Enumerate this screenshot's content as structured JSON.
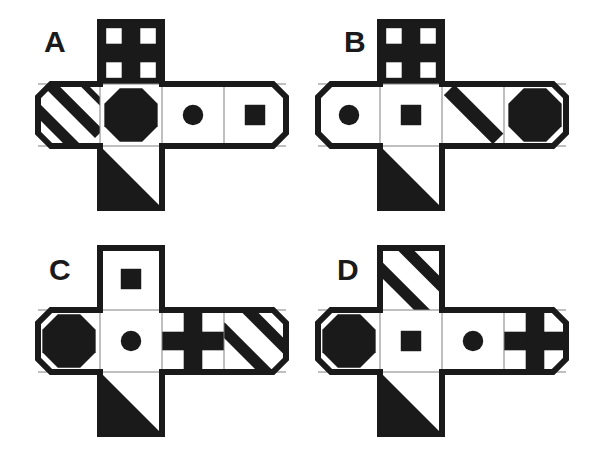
{
  "page": {
    "background_color": "#ffffff",
    "ink_color": "#1a1a1a",
    "width": 599,
    "height": 451
  },
  "geometry": {
    "cell": 62,
    "corner_cut": 13,
    "outline_width": 6,
    "inner_line_width": 1,
    "column_index": 1,
    "columns": 4,
    "rows": 3
  },
  "figures": [
    {
      "id": "A",
      "label": "A",
      "label_x": 44,
      "label_y": 27,
      "origin_x": 0,
      "origin_y": 0,
      "net_x": 38,
      "net_y": 22,
      "panels": {
        "top": {
          "name": "cross",
          "style": "inverted-cross"
        },
        "left": {
          "name": "stripes",
          "style": "stripes-nesw"
        },
        "center": {
          "name": "octagon",
          "style": "octagon-filled"
        },
        "right1": {
          "name": "circle",
          "style": "circle-filled"
        },
        "right2": {
          "name": "square",
          "style": "square-filled"
        },
        "bottom": {
          "name": "triangle",
          "style": "triangle-lower-left"
        }
      }
    },
    {
      "id": "B",
      "label": "B",
      "label_x": 344,
      "label_y": 27,
      "origin_x": 300,
      "origin_y": 0,
      "net_x": 18,
      "net_y": 22,
      "panels": {
        "top": {
          "name": "cross",
          "style": "inverted-cross"
        },
        "left": {
          "name": "circle",
          "style": "circle-filled"
        },
        "center": {
          "name": "square",
          "style": "square-filled"
        },
        "right1": {
          "name": "stripes",
          "style": "stripe-single-nwse"
        },
        "right2": {
          "name": "octagon",
          "style": "octagon-filled"
        },
        "bottom": {
          "name": "triangle",
          "style": "triangle-lower-left"
        }
      }
    },
    {
      "id": "C",
      "label": "C",
      "label_x": 49,
      "label_y": 255,
      "origin_x": 0,
      "origin_y": 226,
      "net_x": 38,
      "net_y": 22,
      "panels": {
        "top": {
          "name": "square",
          "style": "square-filled"
        },
        "left": {
          "name": "octagon",
          "style": "octagon-filled"
        },
        "center": {
          "name": "circle",
          "style": "circle-filled"
        },
        "right1": {
          "name": "cross",
          "style": "cross-filled"
        },
        "right2": {
          "name": "stripes",
          "style": "stripes-nwse"
        },
        "bottom": {
          "name": "triangle",
          "style": "triangle-lower-left"
        }
      }
    },
    {
      "id": "D",
      "label": "D",
      "label_x": 337,
      "label_y": 255,
      "origin_x": 300,
      "origin_y": 226,
      "net_x": 18,
      "net_y": 22,
      "panels": {
        "top": {
          "name": "stripes",
          "style": "stripes-nwse"
        },
        "left": {
          "name": "octagon",
          "style": "octagon-filled"
        },
        "center": {
          "name": "square",
          "style": "square-filled"
        },
        "right1": {
          "name": "circle",
          "style": "circle-filled"
        },
        "right2": {
          "name": "cross",
          "style": "cross-filled"
        },
        "bottom": {
          "name": "triangle",
          "style": "triangle-lower-left"
        }
      }
    }
  ]
}
